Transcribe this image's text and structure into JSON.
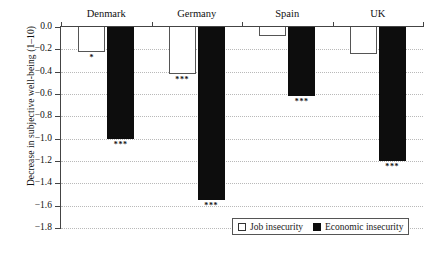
{
  "chart_data": {
    "type": "bar",
    "title": "",
    "subtitle": "",
    "xlabel": "",
    "ylabel": "Decrease in subjective well-being (1–10)",
    "categories": [
      "Denmark",
      "Germany",
      "Spain",
      "UK"
    ],
    "ylim": [
      -1.8,
      0.0
    ],
    "ytick_labels": [
      "0.0",
      "−0.2",
      "−0.4",
      "−0.6",
      "−0.8",
      "−1.0",
      "−1.2",
      "−1.4",
      "−1.6",
      "−1.8"
    ],
    "ytick_values": [
      0.0,
      -0.2,
      -0.4,
      -0.6,
      -0.8,
      -1.0,
      -1.2,
      -1.4,
      -1.6,
      -1.8
    ],
    "grid": true,
    "legend_position": "bottom-right",
    "series": [
      {
        "name": "Job insecurity",
        "style": "open",
        "color": "#ffffff",
        "edge_color": "#555555",
        "values": [
          -0.22,
          -0.42,
          -0.08,
          -0.24
        ],
        "annotations": [
          "*",
          "***",
          "",
          ""
        ]
      },
      {
        "name": "Economic insecurity",
        "style": "filled",
        "color": "#0d0d0d",
        "edge_color": "#0d0d0d",
        "values": [
          -1.0,
          -1.55,
          -0.62,
          -1.2
        ],
        "annotations": [
          "***",
          "***",
          "***",
          "***"
        ]
      }
    ]
  },
  "legend": {
    "entries": [
      {
        "label": "Job insecurity",
        "swatch": "open-square-icon"
      },
      {
        "label": "Economic insecurity",
        "swatch": "filled-square-icon"
      }
    ]
  }
}
